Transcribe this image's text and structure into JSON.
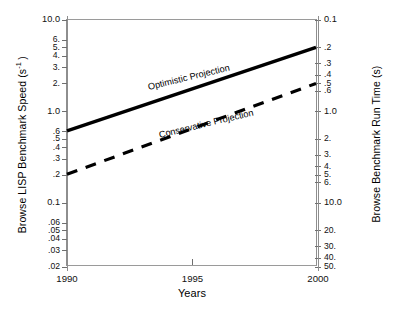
{
  "chart_data": {
    "type": "line",
    "title": "",
    "xlabel": "Years",
    "ylabel": "Browse LISP Benchmark Speed (s⁻¹)",
    "ylabel_right": "Browse Benchmark Run Time (s)",
    "xlim": [
      1990,
      2000
    ],
    "xticks": [
      1990,
      1995,
      2000
    ],
    "xtick_labels": [
      "1990",
      "1995",
      "2000"
    ],
    "yscale": "log",
    "ylim": [
      0.02,
      10.0
    ],
    "yticks_left": [
      10.0,
      6,
      5,
      4,
      3,
      2,
      1.0,
      0.6,
      0.5,
      0.4,
      0.3,
      0.2,
      0.1,
      0.06,
      0.05,
      0.04,
      0.03,
      0.02
    ],
    "ytick_labels_left": [
      "10.0",
      "6.",
      "5.",
      "4.",
      "3.",
      "2.",
      "1.0",
      ".6",
      ".5",
      ".4",
      ".3",
      ".2",
      "0.1",
      ".06",
      ".05",
      ".04",
      ".03",
      ".02"
    ],
    "yticks_right": [
      0.1,
      0.2,
      0.3,
      0.4,
      0.5,
      0.6,
      1.0,
      2,
      3,
      4,
      5,
      6,
      10.0,
      20,
      30,
      40,
      50
    ],
    "ytick_labels_right": [
      "0.1",
      ".2",
      ".3",
      ".4",
      ".5",
      ".6",
      "1.0",
      "2.",
      "3.",
      "4.",
      "5.",
      "6.",
      "10.0",
      "20.",
      "30.",
      "40.",
      "50."
    ],
    "grid": false,
    "legend_position": "inline-annotation",
    "series": [
      {
        "name": "Optimistic Projection",
        "style": "solid",
        "color": "#000000",
        "x": [
          1990,
          2000
        ],
        "y": [
          0.6,
          5.0
        ]
      },
      {
        "name": "Conservative Projection",
        "style": "dashed",
        "color": "#000000",
        "x": [
          1990,
          2000
        ],
        "y": [
          0.2,
          2.0
        ]
      }
    ],
    "annotations": [
      {
        "text": "Optimistic Projection",
        "x": 1991.6,
        "y": 1.35
      },
      {
        "text": "Conservative Projection",
        "x": 1992.1,
        "y": 0.52
      }
    ]
  },
  "axes": {
    "left_title": "Browse LISP Benchmark Speed (s⁻¹)",
    "right_title": "Browse Benchmark Run Time (s)",
    "bottom_title": "Years"
  },
  "tick_labels": {
    "left": [
      "10.0",
      "6.",
      "5.",
      "4.",
      "3.",
      "2.",
      "1.0",
      ".6",
      ".5",
      ".4",
      ".3",
      ".2",
      "0.1",
      ".06",
      ".05",
      ".04",
      ".03",
      ".02"
    ],
    "right": [
      "0.1",
      ".2",
      ".3",
      ".4",
      ".5",
      ".6",
      "1.0",
      "2.",
      "3.",
      "4.",
      "5.",
      "6.",
      "10.0",
      "20.",
      "30.",
      "40.",
      "50."
    ],
    "bottom": [
      "1990",
      "1995",
      "2000"
    ]
  },
  "annotations": {
    "optimistic": "Optimistic Projection",
    "conservative": "Conservative Projection"
  }
}
